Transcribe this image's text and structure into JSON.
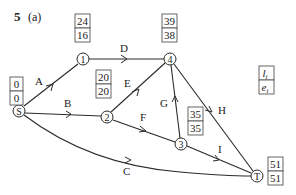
{
  "title": {
    "number": "5",
    "part": "(a)"
  },
  "nodes": [
    {
      "id": "S",
      "label": "S",
      "x": 19,
      "y": 111
    },
    {
      "id": "1",
      "label": "1",
      "x": 83,
      "y": 59
    },
    {
      "id": "2",
      "label": "2",
      "x": 107,
      "y": 117
    },
    {
      "id": "3",
      "label": "3",
      "x": 181,
      "y": 144
    },
    {
      "id": "4",
      "label": "4",
      "x": 170,
      "y": 59
    },
    {
      "id": "T",
      "label": "T",
      "x": 257,
      "y": 176
    }
  ],
  "edges": [
    {
      "label": "A",
      "from": "S",
      "to": "1"
    },
    {
      "label": "B",
      "from": "S",
      "to": "2"
    },
    {
      "label": "C",
      "from": "S",
      "to": "T"
    },
    {
      "label": "D",
      "from": "1",
      "to": "4"
    },
    {
      "label": "E",
      "from": "2",
      "to": "4"
    },
    {
      "label": "F",
      "from": "2",
      "to": "3"
    },
    {
      "label": "G",
      "from": "3",
      "to": "4"
    },
    {
      "label": "H",
      "from": "4",
      "to": "T"
    },
    {
      "label": "I",
      "from": "3",
      "to": "T"
    }
  ],
  "event_boxes": {
    "S": {
      "late": "0",
      "early": "0"
    },
    "1": {
      "late": "24",
      "early": "16"
    },
    "2": {
      "late": "20",
      "early": "20"
    },
    "3": {
      "late": "35",
      "early": "35"
    },
    "4": {
      "late": "39",
      "early": "38"
    },
    "T": {
      "late": "51",
      "early": "51"
    }
  },
  "legend": {
    "top": "l",
    "top_sub": "i",
    "bottom": "e",
    "bottom_sub": "i"
  }
}
